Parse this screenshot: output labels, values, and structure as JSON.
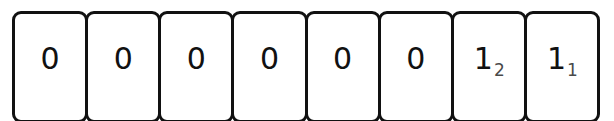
{
  "figure": {
    "kind": "bit-cell-strip",
    "cell_count": 8,
    "stroke_color": "#111111",
    "fill_color": "#ffffff",
    "subscript_color": "#4a4a4a"
  },
  "cells": [
    {
      "digit": "0",
      "subscript": ""
    },
    {
      "digit": "0",
      "subscript": ""
    },
    {
      "digit": "0",
      "subscript": ""
    },
    {
      "digit": "0",
      "subscript": ""
    },
    {
      "digit": "0",
      "subscript": ""
    },
    {
      "digit": "0",
      "subscript": ""
    },
    {
      "digit": "1",
      "subscript": "2"
    },
    {
      "digit": "1",
      "subscript": "1"
    }
  ]
}
